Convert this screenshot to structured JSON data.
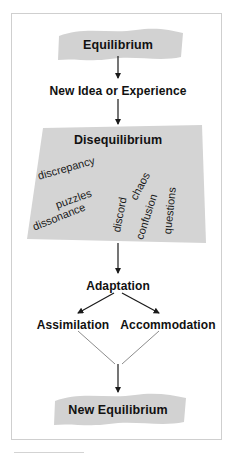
{
  "diagram": {
    "colors": {
      "banner_fill": "#d2d2d2",
      "trapezoid_fill": "#d4d4d4",
      "frame_border": "#cfcfcf",
      "text": "#111111",
      "arrow": "#1a1a1a"
    },
    "nodes": {
      "equilibrium": "Equilibrium",
      "new_idea": "New Idea or Experience",
      "disequilibrium": "Disequilibrium",
      "adaptation": "Adaptation",
      "assimilation": "Assimilation",
      "accommodation": "Accommodation",
      "new_equilibrium": "New Equilibrium"
    },
    "scattered_words": [
      "discrepancy",
      "puzzles",
      "dissonance",
      "discord",
      "chaos",
      "confusion",
      "questions"
    ]
  }
}
